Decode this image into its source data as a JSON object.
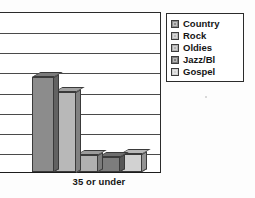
{
  "chart_data": {
    "type": "bar",
    "title": "",
    "subtitle": "",
    "xlabel": "",
    "ylabel": "",
    "categories": [
      "35 or under"
    ],
    "series": [
      {
        "name": "Country",
        "values": [
          4.7
        ],
        "color": "#8c8c8c"
      },
      {
        "name": "Rock",
        "values": [
          4.0
        ],
        "color": "#b8b8b8"
      },
      {
        "name": "Oldies",
        "values": [
          0.85
        ],
        "color": "#b0b0b0"
      },
      {
        "name": "Jazz/Bl",
        "values": [
          0.75
        ],
        "color": "#7d7d7d"
      },
      {
        "name": "Gospel",
        "values": [
          0.9
        ],
        "color": "#d2d2d2"
      }
    ],
    "ylim": [
      0,
      8
    ],
    "gridlines": 7,
    "grid": true,
    "legend_position": "top-right",
    "style": "3d-bar-grayscale"
  },
  "legend": {
    "items": [
      {
        "label": "Country",
        "color": "#8c8c8c"
      },
      {
        "label": "Rock",
        "color": "#b8b8b8"
      },
      {
        "label": "Oldies",
        "color": "#b0b0b0"
      },
      {
        "label": "Jazz/Bl",
        "color": "#7d7d7d"
      },
      {
        "label": "Gospel",
        "color": "#d2d2d2"
      }
    ]
  },
  "axis": {
    "category_label": "35 or under"
  },
  "colors": {
    "axis_line": "#2b2b2b",
    "gridline": "#4a4a4a",
    "background": "#ffffff",
    "text": "#151515"
  }
}
